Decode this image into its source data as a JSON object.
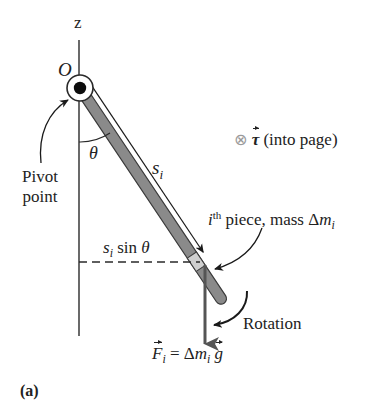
{
  "figure": {
    "panel_label": "(a)",
    "axis_label": "z",
    "origin_label": "O",
    "pivot_label_line1": "Pivot",
    "pivot_label_line2": "point",
    "angle_label": "θ",
    "distance_label": {
      "symbol": "s",
      "subscript": "i"
    },
    "lever_arm_label": {
      "symbol": "s",
      "subscript": "i",
      "text": " sin ",
      "angle": "θ"
    },
    "torque_label": {
      "symbol_icon": "into-page-icon",
      "glyph": "⊗",
      "vector": "τ",
      "text": " (into page)"
    },
    "piece_label": {
      "index": "i",
      "superscript": "th",
      "text": " piece, mass ",
      "delta": "Δ",
      "mass": "m",
      "subscript": "i"
    },
    "rotation_label": "Rotation",
    "force_label": {
      "vector": "F",
      "subscript": "i",
      "equals": " = ",
      "delta": "Δ",
      "mass": "m",
      "mass_subscript": "i",
      "gravity": "g"
    }
  },
  "colors": {
    "rod_fill": "#8a8a8a",
    "rod_outline": "#3a3a3a",
    "piece_fill": "#c8c8c8",
    "line": "#2a2a2a",
    "force_arrow": "#555555",
    "torque_symbol": "#9a9a9a"
  },
  "geometry": {
    "pivot": [
      80,
      88
    ],
    "rod_end": [
      224,
      303
    ],
    "theta_deg": 33.8,
    "dashed_line_y": 262,
    "force_arrow_x": 205
  }
}
